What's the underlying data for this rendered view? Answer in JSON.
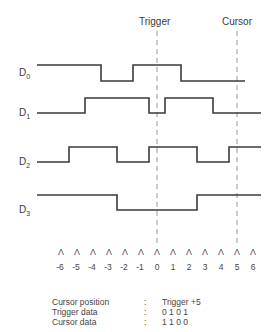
{
  "markers": {
    "trigger_label": "Trigger",
    "cursor_label": "Cursor",
    "trigger_t": 0,
    "cursor_t": 5
  },
  "channels": [
    {
      "label": "D",
      "sub": "0",
      "initial": 1,
      "transitions": [
        -3.5,
        -1.5,
        1.5
      ],
      "end_t": 5.5
    },
    {
      "label": "D",
      "sub": "1",
      "initial": 0,
      "transitions": [
        -4.5,
        -0.5,
        0.5,
        3.5
      ],
      "end_t": 6.5
    },
    {
      "label": "D",
      "sub": "2",
      "initial": 0,
      "transitions": [
        -5.5,
        -2.5,
        -0.5,
        2.5,
        4.5
      ],
      "end_t": 6.5
    },
    {
      "label": "D",
      "sub": "3",
      "initial": 1,
      "transitions": [
        -2.5,
        2.5
      ],
      "end_t": 6.5
    }
  ],
  "time_axis": {
    "ticks": [
      "-6",
      "-5",
      "-4",
      "-3",
      "-2",
      "-1",
      "0",
      "1",
      "2",
      "3",
      "4",
      "5",
      "6"
    ],
    "tick_glyph": "Λ",
    "start_t": -7.5
  },
  "info": {
    "rows": [
      {
        "key": "Cursor position",
        "sep": ":",
        "value": "Trigger +5"
      },
      {
        "key": "Trigger data",
        "sep": ":",
        "value": "0 1 0 1"
      },
      {
        "key": "Cursor data",
        "sep": ":",
        "value": "1 1 0 0"
      }
    ]
  },
  "colors": {
    "line": "#3a3a3a",
    "dash": "#9a9a9a"
  }
}
